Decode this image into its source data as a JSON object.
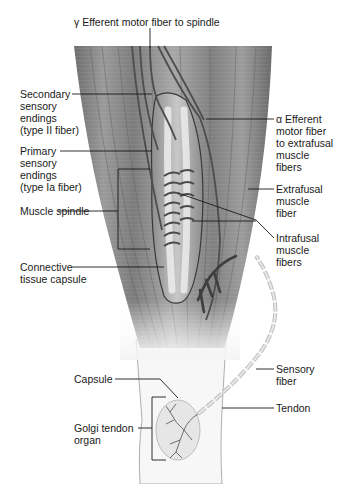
{
  "figure": {
    "background_color": "#ffffff",
    "muscle_color": "#8a8a8a",
    "tendon_color": "#f2f2f2"
  },
  "labels": {
    "gamma_efferent": "γ Efferent motor fiber to spindle",
    "secondary_endings": "Secondary\nsensory\nendings\n(type II fiber)",
    "primary_endings": "Primary\nsensory\nendings\n(type Ia fiber)",
    "muscle_spindle": "Muscle spindle",
    "connective_capsule": "Connective\ntissue capsule",
    "alpha_efferent": "α Efferent\nmotor fiber\nto extrafusal\nmuscle\nfibers",
    "extrafusal": "Extrafusal\nmuscle\nfiber",
    "intrafusal": "Intrafusal\nmuscle\nfibers",
    "capsule": "Capsule",
    "golgi_tendon_organ": "Golgi tendon\norgan",
    "sensory_fiber": "Sensory\nfiber",
    "tendon": "Tendon"
  }
}
